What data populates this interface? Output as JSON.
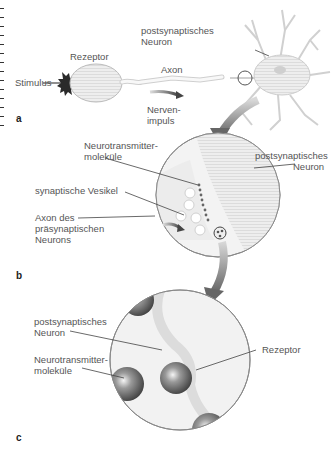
{
  "figure": {
    "panels": [
      {
        "id": "a",
        "letter": "a",
        "labels": {
          "stimulus": "Stimulus",
          "receptor": "Rezeptor",
          "axon": "Axon",
          "nerve_impulse_1": "Nerven-",
          "nerve_impulse_2": "impuls",
          "postsynaptic_1": "postsynaptisches",
          "postsynaptic_2": "Neuron"
        }
      },
      {
        "id": "b",
        "letter": "b",
        "labels": {
          "neurotransmitter_1": "Neurotransmitter-",
          "neurotransmitter_2": "moleküle",
          "vesicle": "synaptische Vesikel",
          "axon_pre_1": "Axon des",
          "axon_pre_2": "präsynaptischen",
          "axon_pre_3": "Neurons",
          "postsynaptic_1": "postsynaptisches",
          "postsynaptic_2": "Neuron"
        }
      },
      {
        "id": "c",
        "letter": "c",
        "labels": {
          "postsynaptic_1": "postsynaptisches",
          "postsynaptic_2": "Neuron",
          "neurotransmitter_1": "Neurotransmitter-",
          "neurotransmitter_2": "moleküle",
          "receptor": "Rezeptor"
        }
      }
    ],
    "colors": {
      "line": "#333333",
      "text": "#555555",
      "circle_fill": "#f1f1f1",
      "arrow": "#777777",
      "molecule": "#555555"
    }
  }
}
